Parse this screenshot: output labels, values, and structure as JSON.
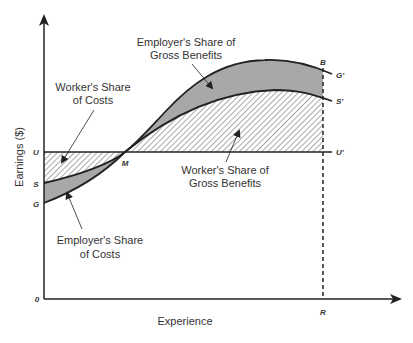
{
  "diagram": {
    "title": "",
    "axes": {
      "x_label": "Experience",
      "y_label": "Earnings ($)",
      "origin_label": "0"
    },
    "points": {
      "U": "U",
      "S": "S",
      "G": "G",
      "M": "M",
      "B": "B",
      "R": "R",
      "U_prime": "U'",
      "S_prime": "S'",
      "G_prime": "G'"
    },
    "annotations": {
      "employer_benefits": [
        "Employer's Share of",
        "Gross Benefits"
      ],
      "worker_costs": [
        "Worker's Share",
        "of Costs"
      ],
      "worker_benefits": [
        "Worker's Share of",
        "Gross Benefits"
      ],
      "employer_costs": [
        "Employer's Share",
        "of Costs"
      ]
    },
    "colors": {
      "axis": "#333333",
      "employer_shade": "#a8a8a8",
      "worker_hatch": "#555555"
    }
  }
}
